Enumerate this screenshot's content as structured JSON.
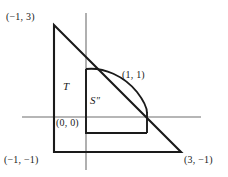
{
  "figure": {
    "kind": "geometry-diagram",
    "colors": {
      "ink": "#1a1a1a",
      "axis": "#6f6f6f",
      "background": "#ffffff"
    },
    "axes": {
      "x_axis": {
        "from_x": 22,
        "to_x": 201,
        "y": 117
      },
      "y_axis": {
        "x": 86,
        "from_y": 13,
        "to_y": 170
      }
    },
    "labels": {
      "vertex_top_left": "(−1, 3)",
      "vertex_bottom_left": "(−1, −1)",
      "vertex_bottom_right": "(3, −1)",
      "tangent_point": "(1, 1)",
      "origin": "(0, 0)",
      "region_outer": "T",
      "region_inner_letter": "S",
      "region_inner_prime": "″"
    },
    "geometry": {
      "triangle_vertices_px": [
        [
          54,
          25
        ],
        [
          54,
          152
        ],
        [
          181,
          152
        ]
      ],
      "triangle_vertices_math": [
        [
          -1,
          3
        ],
        [
          -1,
          -1
        ],
        [
          3,
          -1
        ]
      ],
      "inner_region_px": {
        "left_edge_x": 86,
        "top_y": 69,
        "bottom_y": 133,
        "right_edge_x": 147,
        "curve_start": [
          86,
          69
        ],
        "curve_end": [
          147,
          133
        ]
      },
      "tangent_point_px": [
        134,
        86
      ]
    }
  }
}
